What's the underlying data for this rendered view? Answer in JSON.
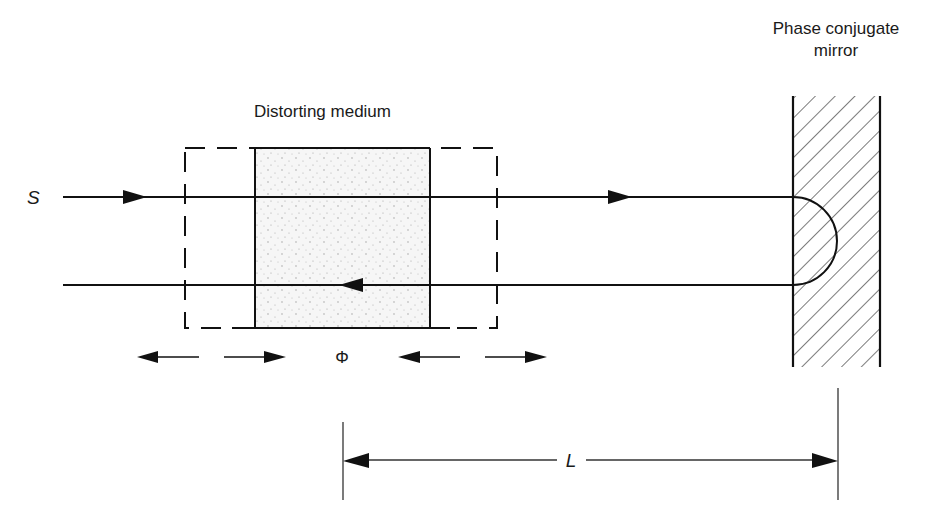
{
  "diagram": {
    "type": "optical-schematic",
    "labels": {
      "source": "S",
      "medium": "Distorting medium",
      "mirror_line1": "Phase conjugate",
      "mirror_line2": "mirror",
      "phase": "Φ",
      "length": "L"
    },
    "components": [
      {
        "id": "incident-beam",
        "label": "S",
        "direction": "right"
      },
      {
        "id": "distorting-medium",
        "label": "Distorting medium",
        "fill": "stippled"
      },
      {
        "id": "medium-envelope",
        "style": "dashed"
      },
      {
        "id": "phase-conjugate-mirror",
        "label": "Phase conjugate mirror",
        "fill": "hatched"
      },
      {
        "id": "return-beam",
        "direction": "left"
      },
      {
        "id": "phase-indicator",
        "label": "Φ"
      },
      {
        "id": "length-dimension",
        "label": "L"
      }
    ],
    "colors": {
      "stroke": "#111111",
      "medium_fill": "#f4f4f4",
      "stipple": "#9a9a9a"
    }
  }
}
